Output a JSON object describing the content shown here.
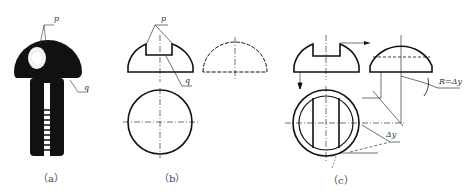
{
  "figure": {
    "panels": [
      {
        "id": "a",
        "caption": "（a）",
        "label_p": "p",
        "label_q": "q"
      },
      {
        "id": "b",
        "caption": "（b）",
        "label_p": "p",
        "label_q": "q"
      },
      {
        "id": "c",
        "caption": "（c）",
        "radius_label": "R=Δy",
        "delta_label": "Δy"
      }
    ]
  },
  "colors": {
    "line": "#111111",
    "dash": "#333333",
    "bolt": "#111111",
    "highlight": "#f4f4f4"
  }
}
